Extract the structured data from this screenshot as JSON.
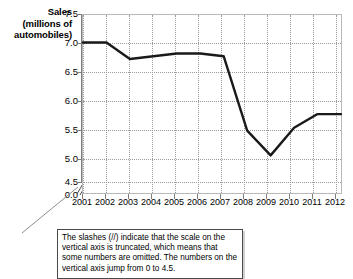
{
  "chart_data": {
    "type": "line",
    "title": "",
    "ylabel_lines": [
      "Sales",
      "(millions of",
      "automobiles)"
    ],
    "ylabel": "Sales (millions of automobiles)",
    "xlabel": "",
    "categories": [
      "2001",
      "2002",
      "2003",
      "2004",
      "2005",
      "2006",
      "2007",
      "2008",
      "2009",
      "2010",
      "2011",
      "2012"
    ],
    "values": [
      7.0,
      7.0,
      6.7,
      6.75,
      6.8,
      6.8,
      6.75,
      5.4,
      4.95,
      5.45,
      5.7,
      5.7
    ],
    "series": [
      {
        "name": "Automobile sales",
        "values": [
          7.0,
          7.0,
          6.7,
          6.75,
          6.8,
          6.8,
          6.75,
          5.4,
          4.95,
          5.45,
          5.7,
          5.7
        ]
      }
    ],
    "ytick_labels": [
      "7.5",
      "7.0",
      "6.5",
      "6.0",
      "5.5",
      "5.0",
      "4.5",
      "0.0"
    ],
    "ytick_values": [
      7.5,
      7.0,
      6.5,
      6.0,
      5.5,
      5.0,
      4.5,
      0.0
    ],
    "ylim": [
      4.5,
      7.5
    ],
    "y_axis_truncated": true,
    "y_axis_break_between": [
      0.0,
      4.5
    ],
    "grid": true,
    "legend": "none",
    "line_color": "#1a1a1a",
    "grid_color": "#9a9a9a",
    "frame_color": "#b9b9b9"
  },
  "caption": {
    "text": "The slashes (//) indicate that the scale on the vertical axis is truncated, which means that some numbers are omitted.  The numbers on the vertical axis jump from 0 to 4.5."
  }
}
